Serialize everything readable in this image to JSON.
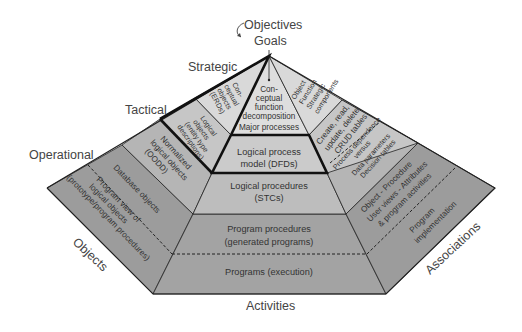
{
  "colors": {
    "strategic": "#d9d9d9",
    "tactical": "#c6c6c6",
    "operational": "#b3b3b3",
    "implementation": "#9c9c9c",
    "outline": "#1a1a1a",
    "text": "#333333"
  },
  "top": {
    "objectives": "Objectives",
    "goals": "Goals"
  },
  "levels": {
    "strategic": "Strategic",
    "tactical": "Tactical",
    "operational": "Operational"
  },
  "axes": {
    "objects": "Objects",
    "activities": "Activities",
    "associations": "Associations"
  },
  "center": {
    "strategic": [
      "Con-",
      "ceptual",
      "function",
      "decomposition",
      "Major processes"
    ],
    "tactical": [
      "Logical process",
      "model (DFDs)"
    ],
    "operational": [
      "Logical procedures",
      "(STCs)"
    ],
    "program_procedures": [
      "Program procedures",
      "(generated programs)"
    ],
    "programs": "Programs (execution)"
  },
  "left": {
    "strategic": [
      "Con-",
      "ceptual",
      "objects",
      "(ERDs)"
    ],
    "tactical": [
      "Logical",
      "objects",
      "(entity type",
      "descriptions)"
    ],
    "operational": [
      "Normalized",
      "logical objects",
      "(OODD)"
    ],
    "database": "Database objects",
    "program_view": [
      "Program view of",
      "logical objects",
      "(prototype/program procedures)"
    ]
  },
  "right": {
    "strategic": [
      "Object",
      "Function",
      "Strategic",
      "components"
    ],
    "tactical_crud": [
      "Create, read,",
      "update, delete",
      "CRUD tables"
    ],
    "tactical_process": [
      "Process dependence",
      "versus",
      "Data parameters",
      "Decision tables"
    ],
    "object_procedure": [
      "Object - Procedure",
      "User views - Attributes",
      "& program activities"
    ],
    "program_impl": [
      "Program",
      "implementation"
    ]
  }
}
